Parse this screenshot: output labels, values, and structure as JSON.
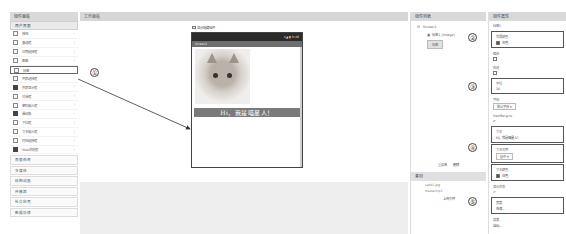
{
  "palette": {
    "title": "组件面板",
    "section": "用户界面",
    "items": [
      {
        "label": "按钮",
        "icon": "button-icon"
      },
      {
        "label": "复选框",
        "icon": "checkbox-icon"
      },
      {
        "label": "日期选择框",
        "icon": "datepicker-icon"
      },
      {
        "label": "图像",
        "icon": "image-icon"
      },
      {
        "label": "标签",
        "icon": "label-icon",
        "selected": true
      },
      {
        "label": "列表选择框",
        "icon": "listpicker-icon"
      },
      {
        "label": "列表显示框",
        "icon": "listview-icon",
        "dark": true
      },
      {
        "label": "对话框",
        "icon": "notifier-icon"
      },
      {
        "label": "密码输入框",
        "icon": "password-icon"
      },
      {
        "label": "滑动条",
        "icon": "slider-icon",
        "dark": true
      },
      {
        "label": "下拉框",
        "icon": "spinner-icon"
      },
      {
        "label": "文本输入框",
        "icon": "textbox-icon"
      },
      {
        "label": "时间选择框",
        "icon": "timepicker-icon"
      },
      {
        "label": "Web浏览框",
        "icon": "webviewer-icon",
        "dark": true
      }
    ],
    "help_glyph": "?",
    "categories": [
      "界面布局",
      "多媒体",
      "绘图动画",
      "传感器",
      "社交应用",
      "数据存储"
    ]
  },
  "viewer": {
    "title": "工作面板",
    "tablet_checkbox_label": "显示隐藏组件",
    "phone": {
      "status": "▾◢ ▮ 9:48",
      "screen_title": "Screen1",
      "label_text": "Hi，我是喵星人！"
    }
  },
  "components": {
    "title": "组件列表",
    "tree": {
      "root": "Screen1",
      "child": "标签1 (Image)",
      "child_button": "标签"
    },
    "rename": "重命名",
    "delete": "删除"
  },
  "media": {
    "title": "素材",
    "files": [
      "cat01.jpg",
      "meow.mp3"
    ],
    "upload": "上传文件"
  },
  "properties": {
    "title": "组件属性",
    "component": "标签1",
    "items": [
      {
        "label": "背景颜色",
        "value": "灰色",
        "swatch": true,
        "framed": true
      },
      {
        "label": "粗体",
        "value": "",
        "checkbox": true
      },
      {
        "label": "斜体",
        "value": "",
        "checkbox": true
      },
      {
        "label": "字号",
        "value": "16",
        "framed": true
      },
      {
        "label": "字体",
        "value": "默认字体",
        "select": true
      },
      {
        "label": "HasMargins",
        "value": "✔"
      },
      {
        "label": "文本",
        "value": "Hi，我是喵星人！",
        "framed": true
      },
      {
        "label": "文本对齐",
        "value": "居中",
        "select": true,
        "framed": true
      },
      {
        "label": "文本颜色",
        "value": "白色",
        "swatch": true,
        "framed": true
      },
      {
        "label": "显示状态",
        "value": "✔"
      },
      {
        "label": "宽度",
        "value": "充满...",
        "framed": true
      },
      {
        "label": "高度",
        "value": "自动..."
      }
    ]
  },
  "annotations": [
    "①",
    "②",
    "③",
    "④",
    "⑤"
  ]
}
